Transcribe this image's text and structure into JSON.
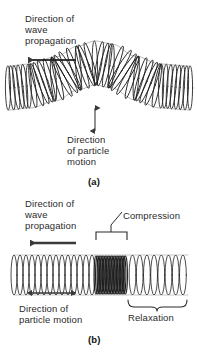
{
  "figure": {
    "background_color": "#ffffff",
    "ink_color": "#1f1f1f"
  },
  "panels": [
    {
      "letter": "(a)",
      "wave_type": "transverse",
      "labels": {
        "wave_propagation": "Direction of\nwave\npropagation",
        "particle_motion": "Direction\nof particle\nmotion"
      },
      "arrows": {
        "wave_propagation": "left-arrow",
        "particle_motion": "vertical-double-arrow"
      }
    },
    {
      "letter": "(b)",
      "wave_type": "longitudinal",
      "labels": {
        "wave_propagation": "Direction of\nwave\npropagation",
        "particle_motion": "Direction of\nparticle motion",
        "compression": "Compression",
        "relaxation": "Relaxation"
      },
      "arrows": {
        "wave_propagation": "left-arrow",
        "particle_motion": "horizontal-double-arrow"
      },
      "annotations": {
        "compression_bracket": "square-bracket-up",
        "relaxation_brace": "curly-brace-down"
      }
    }
  ],
  "chart_data": {
    "type": "line",
    "xlabel": "",
    "ylabel": "",
    "panels": [
      {
        "name": "(a) transverse wave",
        "description": "Helical spring whose axis follows a single sinusoidal crest; particles move perpendicular to propagation.",
        "axis_path_points": [
          {
            "x": 8,
            "y": 88
          },
          {
            "x": 30,
            "y": 86
          },
          {
            "x": 55,
            "y": 79
          },
          {
            "x": 78,
            "y": 68
          },
          {
            "x": 95,
            "y": 63
          },
          {
            "x": 112,
            "y": 66
          },
          {
            "x": 135,
            "y": 78
          },
          {
            "x": 160,
            "y": 86
          },
          {
            "x": 190,
            "y": 88
          }
        ],
        "coil_count": 44,
        "coil_half_height": 22,
        "propagation_direction": "left",
        "particle_motion_direction": "vertical"
      },
      {
        "name": "(b) longitudinal wave",
        "description": "Straight helical spring with a dense compression band and a spread-out relaxation region.",
        "axis_y": 275,
        "x_start": 14,
        "x_end": 188,
        "coil_half_height": 20,
        "compression_span": [
          96,
          126
        ],
        "relaxation_span": [
          127,
          188
        ],
        "coil_count_total": 52,
        "propagation_direction": "left",
        "particle_motion_direction": "horizontal"
      }
    ]
  }
}
